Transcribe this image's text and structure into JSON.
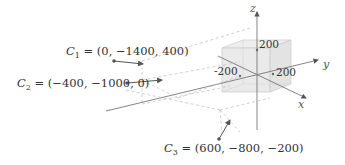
{
  "diagram": {
    "type": "3d-scene",
    "axes": {
      "x": "x",
      "y": "y",
      "z": "z"
    },
    "cube": {
      "ticks": {
        "z": "200",
        "y": "200",
        "neg_y": "-200"
      }
    },
    "cameras": [
      {
        "name": "C",
        "sub": "1",
        "coords": "= (0, −1400, 400)"
      },
      {
        "name": "C",
        "sub": "2",
        "coords": "= (−400, −1000, 0)"
      },
      {
        "name": "C",
        "sub": "3",
        "coords": "= (600, −800, −200)"
      }
    ]
  }
}
